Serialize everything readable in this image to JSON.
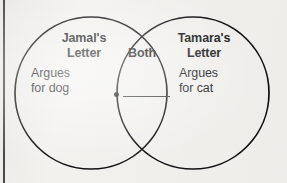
{
  "diagram": {
    "type": "venn-two-circle",
    "background_color": "#f2f1ee",
    "stroke_color": "#111114",
    "text_color": "#17171a",
    "left_set": {
      "title": "Jamal's\nLetter",
      "body": "Argues\nfor dog"
    },
    "right_set": {
      "title": "Tamara's\nLetter",
      "body": "Argues\nfor cat"
    },
    "overlap": {
      "title": "Both",
      "bullet_icon": "bullet-dot-icon",
      "answer_value": ""
    }
  }
}
